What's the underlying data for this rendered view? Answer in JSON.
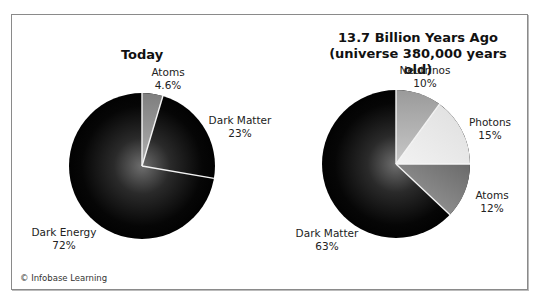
{
  "chart_data": [
    {
      "type": "pie",
      "title": "Today",
      "subtitle": "",
      "categories": [
        "Atoms",
        "Dark Matter",
        "Dark Energy"
      ],
      "values": [
        4.6,
        23,
        72
      ],
      "labels": [
        "4.6%",
        "23%",
        "72%"
      ],
      "colors": [
        "#8c8c8c",
        "#000000",
        "#000000"
      ]
    },
    {
      "type": "pie",
      "title": "13.7 Billion Years Ago",
      "subtitle": "(universe 380,000 years old)",
      "categories": [
        "Neutrinos",
        "Photons",
        "Atoms",
        "Dark Matter"
      ],
      "values": [
        10,
        15,
        12,
        63
      ],
      "labels": [
        "10%",
        "15%",
        "12%",
        "63%"
      ],
      "colors": [
        "#a6a6a6",
        "#e6e6e6",
        "#7a7a7a",
        "#000000"
      ]
    }
  ],
  "left": {
    "title": "Today",
    "atoms": {
      "name": "Atoms",
      "value": "4.6%"
    },
    "dark_matter": {
      "name": "Dark Matter",
      "value": "23%"
    },
    "dark_energy": {
      "name": "Dark Energy",
      "value": "72%"
    }
  },
  "right": {
    "title": "13.7 Billion Years Ago",
    "subtitle": "(universe 380,000 years old)",
    "neutrinos": {
      "name": "Neutrinos",
      "value": "10%"
    },
    "photons": {
      "name": "Photons",
      "value": "15%"
    },
    "atoms": {
      "name": "Atoms",
      "value": "12%"
    },
    "dark_matter": {
      "name": "Dark Matter",
      "value": "63%"
    }
  },
  "credit": "© Infobase Learning"
}
